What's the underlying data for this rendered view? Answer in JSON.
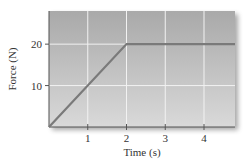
{
  "chart_data": {
    "type": "line",
    "title": "",
    "xlabel": "Time (s)",
    "ylabel": "Force (N)",
    "xlim": [
      0,
      4.8
    ],
    "ylim": [
      0,
      28
    ],
    "x_ticks": [
      1,
      2,
      3,
      4
    ],
    "x_tick_labels": [
      "1",
      "2",
      "3",
      "4"
    ],
    "y_ticks": [
      10,
      20
    ],
    "y_tick_labels": [
      "10",
      "20"
    ],
    "grid": true,
    "legend": null,
    "series": [
      {
        "name": "Force",
        "x": [
          0,
          2,
          4.8
        ],
        "y": [
          0,
          20,
          20
        ]
      }
    ]
  },
  "colors": {
    "plot_bg_top": "#a9a9a9",
    "plot_bg_bottom": "#d9d9d9",
    "grid": "#f2f2f2",
    "line": "#7a7a7a",
    "axis": "#555555",
    "text": "#333333"
  }
}
